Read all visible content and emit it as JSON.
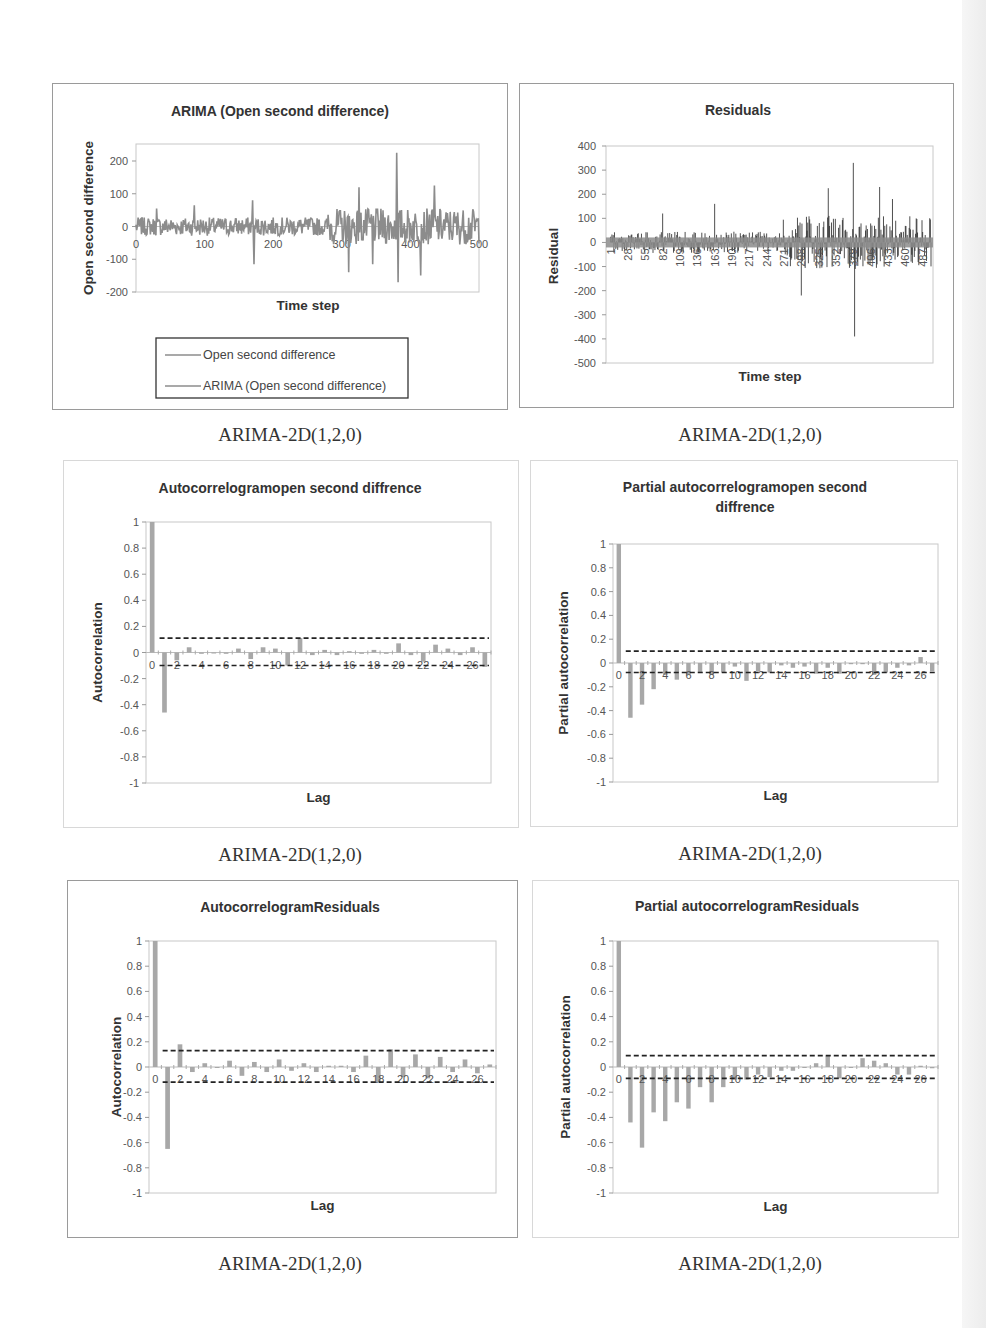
{
  "captions": [
    "ARIMA-2D(1,2,0)",
    "ARIMA-2D(1,2,0)",
    "ARIMA-2D(1,2,0)",
    "ARIMA-2D(1,2,0)",
    "ARIMA-2D(1,2,0)",
    "ARIMA-2D(1,2,0)"
  ],
  "colors": {
    "series": "#8c8c8c",
    "residual": "#222222",
    "bar": "#a8a8a8",
    "confidence": "#222222",
    "frame": "#9a9a9a"
  },
  "chart_data": [
    {
      "id": "open-second-difference",
      "type": "line",
      "title": "ARIMA (Open second difference)",
      "xlabel": "Time step",
      "ylabel": "Open second difference",
      "xlim": [
        0,
        500
      ],
      "ylim": [
        -200,
        250
      ],
      "xticks": [
        "0",
        "100",
        "200",
        "300",
        "400",
        "500"
      ],
      "yticks": [
        "200",
        "100",
        "0",
        "-100",
        "-200"
      ],
      "legend": {
        "position": "bottom",
        "entries": [
          "Open second difference",
          "ARIMA (Open second difference)"
        ]
      },
      "series": [
        {
          "name": "Open second difference",
          "description": "noisy series around 0, amplitude ~±40 up to t=280, then ~±100 with spikes"
        },
        {
          "name": "ARIMA (Open second difference)",
          "description": "overlapping fitted series"
        }
      ],
      "notable_points": [
        {
          "x": 30,
          "y": 55
        },
        {
          "x": 85,
          "y": 65
        },
        {
          "x": 170,
          "y": 80
        },
        {
          "x": 172,
          "y": -115
        },
        {
          "x": 310,
          "y": -140
        },
        {
          "x": 325,
          "y": 120
        },
        {
          "x": 345,
          "y": 110
        },
        {
          "x": 345,
          "y": -115
        },
        {
          "x": 380,
          "y": 225
        },
        {
          "x": 382,
          "y": -170
        },
        {
          "x": 415,
          "y": -150
        },
        {
          "x": 435,
          "y": 125
        }
      ]
    },
    {
      "id": "residuals",
      "type": "bar",
      "title": "Residuals",
      "xlabel": "Time step",
      "ylabel": "Residual",
      "ylim": [
        -500,
        400
      ],
      "yticks": [
        "400",
        "300",
        "200",
        "100",
        "0",
        "-100",
        "-200",
        "-300",
        "-400",
        "-500"
      ],
      "xticks": [
        "1",
        "28",
        "55",
        "82",
        "109",
        "136",
        "163",
        "190",
        "217",
        "244",
        "271",
        "298",
        "325",
        "352",
        "379",
        "406",
        "433",
        "460",
        "487"
      ],
      "notable_points": [
        {
          "x": 82,
          "y": 120
        },
        {
          "x": 163,
          "y": 160
        },
        {
          "x": 298,
          "y": 175
        },
        {
          "x": 298,
          "y": -220
        },
        {
          "x": 340,
          "y": 225
        },
        {
          "x": 379,
          "y": 330
        },
        {
          "x": 381,
          "y": -390
        },
        {
          "x": 420,
          "y": 230
        },
        {
          "x": 440,
          "y": 180
        }
      ]
    },
    {
      "id": "acf-open-second-difference",
      "type": "bar",
      "title": "Autocorrelogramopen second diffrence",
      "xlabel": "Lag",
      "ylabel": "Autocorrelation",
      "ylim": [
        -1,
        1
      ],
      "yticks": [
        "1",
        "0.8",
        "0.6",
        "0.4",
        "0.2",
        "0",
        "-0.2",
        "-0.4",
        "-0.6",
        "-0.8",
        "-1"
      ],
      "xticks": [
        "0",
        "2",
        "4",
        "6",
        "8",
        "10",
        "12",
        "14",
        "16",
        "18",
        "20",
        "22",
        "24",
        "26"
      ],
      "categories": [
        0,
        1,
        2,
        3,
        4,
        5,
        6,
        7,
        8,
        9,
        10,
        11,
        12,
        13,
        14,
        15,
        16,
        17,
        18,
        19,
        20,
        21,
        22,
        23,
        24,
        25,
        26,
        27
      ],
      "values": [
        1.0,
        -0.46,
        -0.06,
        0.04,
        -0.01,
        0.0,
        -0.01,
        0.03,
        -0.05,
        0.04,
        0.03,
        -0.1,
        0.11,
        -0.02,
        0.02,
        -0.02,
        0.01,
        -0.01,
        0.02,
        -0.01,
        0.07,
        -0.02,
        -0.07,
        0.06,
        0.03,
        -0.02,
        0.04,
        -0.11
      ],
      "confidence_upper": 0.11,
      "confidence_lower": -0.1
    },
    {
      "id": "pacf-open-second-difference",
      "type": "bar",
      "title": "Partial autocorrelogramopen second diffrence",
      "xlabel": "Lag",
      "ylabel": "Partial autocorrelation",
      "ylim": [
        -1,
        1
      ],
      "yticks": [
        "1",
        "0.8",
        "0.6",
        "0.4",
        "0.2",
        "0",
        "-0.2",
        "-0.4",
        "-0.6",
        "-0.8",
        "-1"
      ],
      "xticks": [
        "0",
        "2",
        "4",
        "6",
        "8",
        "10",
        "12",
        "14",
        "16",
        "18",
        "20",
        "22",
        "24",
        "26"
      ],
      "categories": [
        0,
        1,
        2,
        3,
        4,
        5,
        6,
        7,
        8,
        9,
        10,
        11,
        12,
        13,
        14,
        15,
        16,
        17,
        18,
        19,
        20,
        21,
        22,
        23,
        24,
        25,
        26,
        27
      ],
      "values": [
        1.0,
        -0.46,
        -0.35,
        -0.22,
        -0.1,
        -0.14,
        -0.1,
        -0.08,
        -0.1,
        -0.08,
        -0.03,
        -0.15,
        -0.07,
        -0.08,
        -0.02,
        -0.04,
        -0.03,
        -0.09,
        -0.04,
        -0.09,
        -0.01,
        -0.01,
        -0.1,
        -0.08,
        -0.04,
        -0.02,
        0.05,
        -0.07
      ],
      "confidence_upper": 0.1,
      "confidence_lower": -0.08
    },
    {
      "id": "acf-residuals",
      "type": "bar",
      "title": "AutocorrelogramResiduals",
      "xlabel": "Lag",
      "ylabel": "Autocorrelation",
      "ylim": [
        -1,
        1
      ],
      "yticks": [
        "1",
        "0.8",
        "0.6",
        "0.4",
        "0.2",
        "0",
        "-0.2",
        "-0.4",
        "-0.6",
        "-0.8",
        "-1"
      ],
      "xticks": [
        "0",
        "2",
        "4",
        "6",
        "8",
        "10",
        "12",
        "14",
        "16",
        "18",
        "20",
        "22",
        "24",
        "26"
      ],
      "categories": [
        0,
        1,
        2,
        3,
        4,
        5,
        6,
        7,
        8,
        9,
        10,
        11,
        12,
        13,
        14,
        15,
        16,
        17,
        18,
        19,
        20,
        21,
        22,
        23,
        24,
        25,
        26,
        27
      ],
      "values": [
        1.0,
        -0.65,
        0.18,
        -0.04,
        0.03,
        0.0,
        0.05,
        -0.07,
        0.04,
        -0.04,
        0.06,
        -0.03,
        0.03,
        -0.04,
        0.01,
        0.01,
        -0.04,
        0.09,
        -0.12,
        0.14,
        -0.08,
        0.1,
        -0.09,
        0.08,
        -0.04,
        0.06,
        -0.05,
        0.02
      ],
      "confidence_upper": 0.13,
      "confidence_lower": -0.12
    },
    {
      "id": "pacf-residuals",
      "type": "bar",
      "title": "Partial autocorrelogramResiduals",
      "xlabel": "Lag",
      "ylabel": "Partial autocorrelation",
      "ylim": [
        -1,
        1
      ],
      "yticks": [
        "1",
        "0.8",
        "0.6",
        "0.4",
        "0.2",
        "0",
        "-0.2",
        "-0.4",
        "-0.6",
        "-0.8",
        "-1"
      ],
      "xticks": [
        "0",
        "2",
        "4",
        "6",
        "8",
        "10",
        "12",
        "14",
        "16",
        "18",
        "20",
        "22",
        "24",
        "26"
      ],
      "categories": [
        0,
        1,
        2,
        3,
        4,
        5,
        6,
        7,
        8,
        9,
        10,
        11,
        12,
        13,
        14,
        15,
        16,
        17,
        18,
        19,
        20,
        21,
        22,
        23,
        24,
        25,
        26,
        27
      ],
      "values": [
        1.0,
        -0.44,
        -0.64,
        -0.36,
        -0.43,
        -0.28,
        -0.33,
        -0.16,
        -0.28,
        -0.16,
        -0.1,
        -0.1,
        -0.06,
        -0.08,
        -0.03,
        -0.03,
        0.0,
        0.03,
        0.09,
        -0.09,
        0.0,
        0.07,
        0.05,
        0.03,
        -0.06,
        -0.06,
        0.01,
        -0.01
      ],
      "confidence_upper": 0.09,
      "confidence_lower": -0.09
    }
  ]
}
